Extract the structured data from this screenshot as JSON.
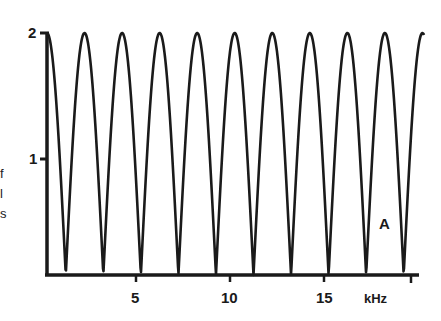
{
  "chart_data": {
    "type": "line",
    "title": "",
    "panel_label": "A",
    "xlabel": "kHz",
    "ylabel": "",
    "x_ticks": [
      5,
      10,
      15
    ],
    "y_ticks": [
      1,
      2
    ],
    "xlim": [
      0,
      20
    ],
    "ylim": [
      0,
      2
    ],
    "grid": false,
    "legend": null,
    "period_khz": 2.0,
    "series": [
      {
        "name": "response",
        "peaks_khz": [
          0,
          2.1,
          4.1,
          6.2,
          8.3,
          10.1,
          12.2,
          14.2,
          16.3,
          18.3
        ],
        "minima_khz": [
          1.0,
          3.1,
          5.1,
          7.2,
          9.2,
          11.2,
          13.2,
          15.3,
          17.2,
          19.3
        ],
        "peak_value": 2,
        "min_value": 0
      }
    ]
  },
  "axis": {
    "y_tick_labels": [
      "1",
      "2"
    ],
    "x_tick_labels": [
      "5",
      "10",
      "15"
    ],
    "x_unit": "kHz"
  },
  "left_fragments": [
    "f",
    "l",
    "s"
  ],
  "panel_label": "A",
  "colors": {
    "ink": "#1a1a1a",
    "background": "#ffffff"
  }
}
